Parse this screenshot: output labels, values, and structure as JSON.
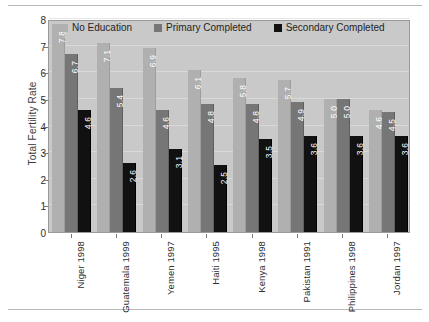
{
  "chart_data": {
    "type": "bar",
    "title": "",
    "subtitle": "",
    "xlabel": "",
    "ylabel": "Total Fertility Rate",
    "ylim": [
      0,
      8
    ],
    "yticks": [
      0,
      1,
      2,
      3,
      4,
      5,
      6,
      7,
      8
    ],
    "ytick_labels": [
      "0",
      "1",
      "2",
      "3",
      "4",
      "5",
      "6",
      "7",
      "8"
    ],
    "grid": true,
    "legend_position": "top-inside",
    "categories": [
      "Niger 1998",
      "Guatemala 1999",
      "Yemen 1997",
      "Haiti 1995",
      "Kenya 1998",
      "Pakistan 1991",
      "Philippines 1998",
      "Jordan 1997"
    ],
    "series": [
      {
        "name": "No Education",
        "color": "#b0b0b0",
        "values": [
          7.8,
          7.1,
          6.9,
          6.1,
          5.8,
          5.7,
          5.0,
          4.6
        ],
        "labels": [
          "7.8",
          "7.1",
          "6.9",
          "6.1",
          "5.8",
          "5.7",
          "5.0",
          "4.6"
        ]
      },
      {
        "name": "Primary Completed",
        "color": "#767676",
        "values": [
          6.7,
          5.4,
          4.6,
          4.8,
          4.8,
          4.9,
          5.0,
          4.5
        ],
        "labels": [
          "6.7",
          "5.4",
          "4.6",
          "4.8",
          "4.8",
          "4.9",
          "5.0",
          "4.5"
        ]
      },
      {
        "name": "Secondary Completed",
        "color": "#111111",
        "values": [
          4.6,
          2.6,
          3.1,
          2.5,
          3.5,
          3.6,
          3.6,
          3.6
        ],
        "labels": [
          "4.6",
          "2.6",
          "3.1",
          "2.5",
          "3.5",
          "3.6",
          "3.6",
          "3.6"
        ]
      }
    ],
    "plot_background": "#c9c9c9",
    "gridline_color": "#dddddd"
  }
}
